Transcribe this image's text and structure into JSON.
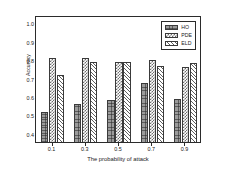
{
  "chart_data": {
    "type": "bar",
    "title": "",
    "xlabel": "The probability of attack",
    "ylabel": "Accuracy",
    "categories": [
      "0.1",
      "0.3",
      "0.5",
      "0.7",
      "0.9"
    ],
    "series": [
      {
        "name": "HO",
        "values": [
          0.52,
          0.56,
          0.585,
          0.675,
          0.59
        ]
      },
      {
        "name": "PDE",
        "values": [
          0.81,
          0.81,
          0.79,
          0.8,
          0.76
        ]
      },
      {
        "name": "ELD",
        "values": [
          0.72,
          0.79,
          0.79,
          0.77,
          0.785
        ]
      }
    ],
    "ylim": [
      0.355,
      1.045
    ],
    "yticks": [
      "1.0",
      "0.9",
      "0.8",
      "0.7",
      "0.6",
      "0.5",
      "0.4"
    ],
    "ytick_values": [
      1.0,
      0.9,
      0.8,
      0.7,
      0.6,
      0.5,
      0.4
    ],
    "xticks": [
      "0.1",
      "0.3",
      "0.5",
      "0.7",
      "0.9"
    ],
    "grid": false,
    "legend_position": "upper right",
    "legend": [
      {
        "label": "HO",
        "pattern": "speckled-grey"
      },
      {
        "label": "PDE",
        "pattern": "checkerboard"
      },
      {
        "label": "ELD",
        "pattern": "diagonal-hatch"
      }
    ]
  }
}
